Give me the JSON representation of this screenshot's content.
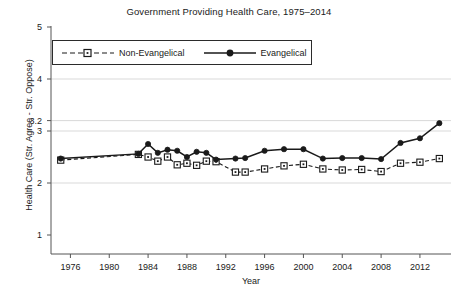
{
  "chart_data": {
    "type": "line",
    "title": "Government Providing Health Care, 1975–2014",
    "xlabel": "Year",
    "ylabel": "Health Care (Str. Agree - Str. Oppose)",
    "xlim": [
      1974,
      2015
    ],
    "ylim": [
      1,
      5
    ],
    "grid": true,
    "grid_values": [
      2,
      3,
      3.2,
      4
    ],
    "legend_position": "top-left-inside",
    "yticks": [
      1,
      2,
      3,
      3.2,
      4,
      5
    ],
    "ytick_labels": [
      "1",
      "2",
      "3",
      "3.2",
      "4",
      "5"
    ],
    "xticks": [
      1976,
      1980,
      1984,
      1988,
      1992,
      1996,
      2000,
      2004,
      2008,
      2012
    ],
    "xtick_labels": [
      "1976",
      "1980",
      "1984",
      "1988",
      "1992",
      "1996",
      "2000",
      "2004",
      "2008",
      "2012"
    ],
    "series": [
      {
        "name": "Non-Evangelical",
        "marker": "square-open",
        "line_style": "dashed",
        "color": "#1a1a1a",
        "x": [
          1975,
          1983,
          1984,
          1985,
          1986,
          1987,
          1988,
          1989,
          1990,
          1991,
          1993,
          1994,
          1996,
          1998,
          2000,
          2002,
          2004,
          2006,
          2008,
          2010,
          2012,
          2014
        ],
        "values": [
          2.44,
          2.55,
          2.5,
          2.42,
          2.5,
          2.35,
          2.38,
          2.34,
          2.42,
          2.41,
          2.21,
          2.21,
          2.27,
          2.33,
          2.36,
          2.27,
          2.25,
          2.26,
          2.22,
          2.38,
          2.4,
          2.47
        ]
      },
      {
        "name": "Evangelical",
        "marker": "circle-filled",
        "line_style": "solid",
        "color": "#1a1a1a",
        "x": [
          1975,
          1983,
          1984,
          1985,
          1986,
          1987,
          1988,
          1989,
          1990,
          1991,
          1993,
          1994,
          1996,
          1998,
          2000,
          2002,
          2004,
          2006,
          2008,
          2010,
          2012,
          2014
        ],
        "values": [
          2.47,
          2.56,
          2.75,
          2.58,
          2.64,
          2.62,
          2.5,
          2.6,
          2.58,
          2.45,
          2.47,
          2.48,
          2.62,
          2.65,
          2.65,
          2.47,
          2.48,
          2.48,
          2.46,
          2.77,
          2.86,
          3.15
        ]
      }
    ]
  },
  "legend": {
    "entries": [
      {
        "label": "Non-Evangelical"
      },
      {
        "label": "Evangelical"
      }
    ]
  }
}
